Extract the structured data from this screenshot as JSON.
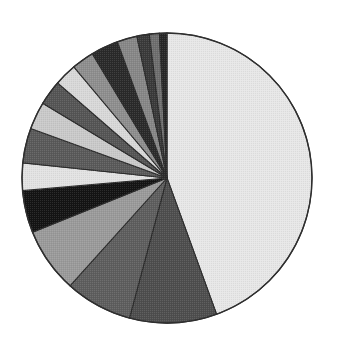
{
  "chart_data": {
    "type": "pie",
    "title": "",
    "subtitle": "",
    "xlabel": "",
    "ylabel": "",
    "legend_position": "none",
    "grid": false,
    "labels_shown": false,
    "start_angle_deg": 0,
    "direction": "clockwise",
    "center": {
      "x": 167,
      "y": 178
    },
    "radius": 145,
    "background_color": "#ffffff",
    "outline_color": "#2f2f2f",
    "categories": [
      "Slice 1",
      "Slice 2",
      "Slice 3",
      "Slice 4",
      "Slice 5",
      "Slice 6",
      "Slice 7",
      "Slice 8",
      "Slice 9",
      "Slice 10",
      "Slice 11",
      "Slice 12",
      "Slice 13",
      "Slice 14",
      "Slice 15",
      "Slice 16"
    ],
    "values": [
      44.4,
      9.7,
      7.5,
      7.2,
      4.7,
      3.1,
      3.9,
      3.1,
      2.8,
      2.5,
      2.5,
      3.1,
      2.2,
      1.4,
      1.1,
      0.8
    ],
    "angles_deg": [
      160.0,
      35.0,
      27.0,
      26.0,
      17.0,
      11.0,
      14.0,
      11.0,
      10.0,
      9.0,
      9.0,
      11.0,
      8.0,
      5.0,
      4.0,
      3.0
    ],
    "colors": [
      "#e7e7e7",
      "#4e4e4e",
      "#5e5e5e",
      "#9a9a9a",
      "#141414",
      "#e2e2e2",
      "#5a5a5a",
      "#c9c9c9",
      "#555555",
      "#d8d8d8",
      "#8e8e8e",
      "#2a2a2a",
      "#878787",
      "#3a3a3a",
      "#6e6e6e",
      "#262626"
    ]
  },
  "accessibility": {
    "figure_role": "Pie chart",
    "description": "Grayscale pie chart with one dominant light slice and fifteen progressively smaller wedges"
  }
}
